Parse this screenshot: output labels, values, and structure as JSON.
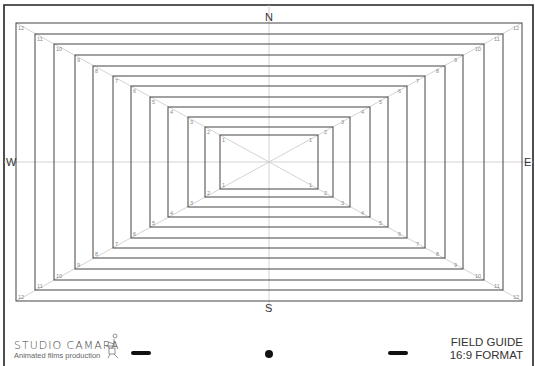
{
  "guide": {
    "center": {
      "x": 269,
      "y": 162
    },
    "frame": {
      "left": 4,
      "top": 5,
      "right": 533,
      "bottom": 366
    },
    "rects": [
      {
        "label": "12",
        "left": 16,
        "top": 23
      },
      {
        "label": "11",
        "left": 35,
        "top": 34
      },
      {
        "label": "10",
        "left": 54,
        "top": 44
      },
      {
        "label": "9",
        "left": 75,
        "top": 55
      },
      {
        "label": "8",
        "left": 93,
        "top": 66
      },
      {
        "label": "7",
        "left": 113,
        "top": 76
      },
      {
        "label": "6",
        "left": 131,
        "top": 86
      },
      {
        "label": "5",
        "left": 150,
        "top": 97
      },
      {
        "label": "4",
        "left": 168,
        "top": 107
      },
      {
        "label": "3",
        "left": 188,
        "top": 117
      },
      {
        "label": "2",
        "left": 205,
        "top": 127
      },
      {
        "label": "1",
        "left": 220,
        "top": 135
      }
    ],
    "line_color": "#444444",
    "guide_color": "#c8c8c8",
    "label_color": "#888888"
  },
  "compass": {
    "north": "N",
    "south": "S",
    "west": "W",
    "east": "E"
  },
  "logo": {
    "title": "STUDIO CAMARA",
    "subtitle": "Animated films production"
  },
  "title_block": {
    "line1": "FIELD GUIDE",
    "line2": "16:9 FORMAT"
  },
  "registration": {
    "left_dash": "dash",
    "center_dot": "dot",
    "right_dash": "dash"
  }
}
